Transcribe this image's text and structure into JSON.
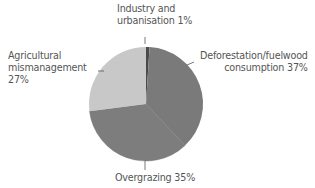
{
  "chart_data": {
    "type": "pie",
    "title": "",
    "start_angle": "12 o'clock",
    "direction": "clockwise",
    "slices": [
      {
        "label": "Industry and urbanisation",
        "value": 1,
        "color": "#4a4a4a"
      },
      {
        "label": "Deforestation/fuelwood consumption",
        "value": 37,
        "color": "#7a7a7a"
      },
      {
        "label": "Overgrazing",
        "value": 35,
        "color": "#7d7d7d"
      },
      {
        "label": "Agricultural mismanagement",
        "value": 27,
        "color": "#c8c8c8"
      }
    ],
    "categories": [
      "Industry and urbanisation",
      "Deforestation/fuelwood consumption",
      "Overgrazing",
      "Agricultural mismanagement"
    ],
    "values": [
      1,
      37,
      35,
      27
    ],
    "units": "%",
    "legend": "none (direct labels)"
  },
  "labels": {
    "industry": {
      "line1": "Industry and",
      "line2": "urbanisation 1%"
    },
    "agri": {
      "line1": "Agricultural",
      "line2": "mismanagement",
      "line3": "27%"
    },
    "defor": {
      "line1": "Deforestation/fuelwood",
      "line2": "consumption 37%"
    },
    "over": {
      "line1": "Overgrazing 35%"
    }
  }
}
